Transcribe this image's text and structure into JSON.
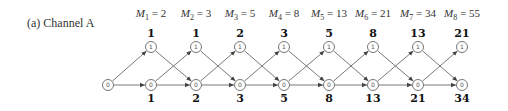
{
  "caption": "(a) Channel A",
  "columns": [
    {
      "m_sub": "1",
      "m_val": "2",
      "top": "1",
      "bottom": "1"
    },
    {
      "m_sub": "2",
      "m_val": "3",
      "top": "1",
      "bottom": "2"
    },
    {
      "m_sub": "3",
      "m_val": "5",
      "top": "2",
      "bottom": "3"
    },
    {
      "m_sub": "4",
      "m_val": "8",
      "top": "3",
      "bottom": "5"
    },
    {
      "m_sub": "5",
      "m_val": "13",
      "top": "5",
      "bottom": "8"
    },
    {
      "m_sub": "6",
      "m_val": "21",
      "top": "8",
      "bottom": "13"
    },
    {
      "m_sub": "7",
      "m_val": "34",
      "top": "13",
      "bottom": "21"
    },
    {
      "m_sub": "8",
      "m_val": "55",
      "top": "21",
      "bottom": "34"
    }
  ],
  "start_node": "0",
  "node_top": "1",
  "node_bottom": "0",
  "colors": {
    "edge": "#555555",
    "node_border": "#777777"
  }
}
